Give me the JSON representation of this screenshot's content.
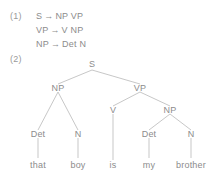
{
  "figure": {
    "background_color": "#ffffff",
    "text_color": "#8c8c8c",
    "line_color": "#b9b9b9"
  },
  "examples": [
    {
      "number": "(1)"
    },
    {
      "number": "(2)"
    }
  ],
  "rules": {
    "arrow_glyph": "→",
    "items": [
      {
        "lhs": "S",
        "arrow": "→",
        "rhs": "NP VP"
      },
      {
        "lhs": "VP",
        "arrow": "→",
        "rhs": "V NP"
      },
      {
        "lhs": "NP",
        "arrow": "→",
        "rhs": "Det N"
      }
    ]
  },
  "tree": {
    "sentence": "that boy is my brother",
    "nodes": {
      "root": "S",
      "np_subject": "NP",
      "vp": "VP",
      "det1": "Det",
      "n1": "N",
      "v": "V",
      "np_object": "NP",
      "det2": "Det",
      "n2": "N"
    },
    "leaves": {
      "that": "that",
      "boy": "boy",
      "is": "is",
      "my": "my",
      "brother": "brother"
    }
  }
}
